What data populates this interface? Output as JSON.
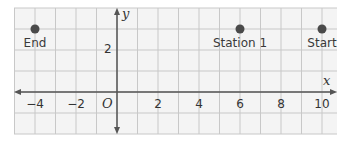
{
  "diagram": {
    "type": "coordinate-plane",
    "x_axis_label": "x",
    "y_axis_label": "y",
    "origin_label": "O",
    "x_range": [
      -5,
      11
    ],
    "y_range": [
      -2,
      4
    ],
    "grid_step": 1,
    "x_ticks": [
      {
        "value": -4,
        "label": "−4"
      },
      {
        "value": -2,
        "label": "−2"
      },
      {
        "value": 2,
        "label": "2"
      },
      {
        "value": 4,
        "label": "4"
      },
      {
        "value": 6,
        "label": "6"
      },
      {
        "value": 8,
        "label": "8"
      },
      {
        "value": 10,
        "label": "10"
      }
    ],
    "y_ticks": [
      {
        "value": 2,
        "label": "2"
      }
    ],
    "points": [
      {
        "name": "End",
        "x": -4,
        "y": 3
      },
      {
        "name": "Station 1",
        "x": 6,
        "y": 3
      },
      {
        "name": "Start",
        "x": 10,
        "y": 3
      }
    ],
    "colors": {
      "grid": "#c8c8c8",
      "axis": "#555555",
      "point": "#4a4a4a",
      "background": "#f4f4f4"
    }
  }
}
